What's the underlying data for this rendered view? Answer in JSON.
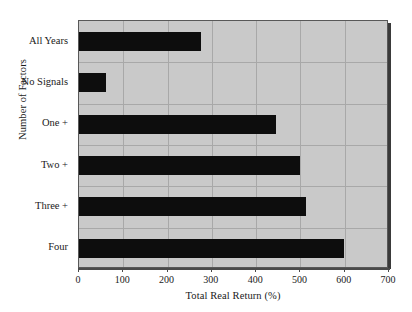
{
  "chart_data": {
    "type": "bar",
    "orientation": "horizontal",
    "title": "",
    "xlabel": "Total Real Return (%)",
    "ylabel": "Number of Factors",
    "categories": [
      "All Years",
      "No Signals",
      "One +",
      "Two +",
      "Three +",
      "Four"
    ],
    "values": [
      275,
      61,
      445,
      499,
      513,
      598
    ],
    "series": [
      {
        "name": "Total Real Return",
        "values": [
          275,
          61,
          445,
          499,
          513,
          598
        ]
      }
    ],
    "xlim": [
      0,
      700
    ],
    "xticks": [
      0,
      100,
      200,
      300,
      400,
      500,
      600,
      700
    ],
    "xtick_labels": [
      "0",
      "100",
      "200",
      "300",
      "400",
      "500",
      "600",
      "700"
    ],
    "grid": true,
    "grid_axes": "both",
    "legend": false,
    "legend_position": "none",
    "bar_color": "#0d0d0d",
    "plot_background": "#c9c9c9",
    "figure_background": "#ffffff",
    "gridline_color": "#a8a8a8",
    "axis_color": "#4a4a4a"
  },
  "axes": {
    "x_title": "Total Real Return (%)",
    "y_title": "Number of Factors"
  }
}
